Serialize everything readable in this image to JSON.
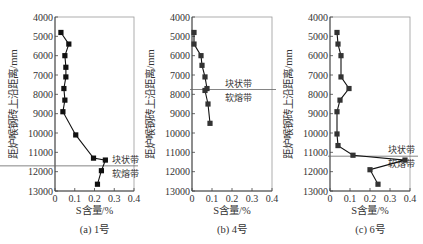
{
  "chart_data": [
    {
      "type": "line",
      "caption": "(a) 1号",
      "xlabel": "S含量/%",
      "ylabel": "距炉喉钢砖上沿距离/mm",
      "xlim": [
        0,
        0.4
      ],
      "ylim": [
        4000,
        13000
      ],
      "y_inverted": true,
      "x_ticks": [
        "0",
        "0.1",
        "0.2",
        "0.3",
        "0.4"
      ],
      "y_ticks": [
        "4000",
        "5000",
        "6000",
        "7000",
        "8000",
        "9000",
        "10000",
        "11000",
        "12000",
        "13000"
      ],
      "marker": "square",
      "boundary_depth": 11700,
      "band_labels": {
        "upper": "块状带",
        "lower": "软熔带"
      },
      "points": [
        {
          "x": 0.03,
          "y": 4800
        },
        {
          "x": 0.07,
          "y": 5400
        },
        {
          "x": 0.05,
          "y": 6000
        },
        {
          "x": 0.055,
          "y": 6600
        },
        {
          "x": 0.055,
          "y": 7100
        },
        {
          "x": 0.045,
          "y": 7700
        },
        {
          "x": 0.05,
          "y": 8300
        },
        {
          "x": 0.04,
          "y": 8900
        },
        {
          "x": 0.105,
          "y": 10100
        },
        {
          "x": 0.195,
          "y": 11300
        },
        {
          "x": 0.255,
          "y": 11400
        },
        {
          "x": 0.235,
          "y": 11950
        },
        {
          "x": 0.215,
          "y": 12650
        }
      ]
    },
    {
      "type": "line",
      "caption": "(b) 4号",
      "xlabel": "S含量/%",
      "ylabel": "距炉喉钢砖上沿距离/mm",
      "xlim": [
        0,
        0.4
      ],
      "ylim": [
        4000,
        13000
      ],
      "y_inverted": true,
      "x_ticks": [
        "0",
        "0.1",
        "0.2",
        "0.3",
        "0.4"
      ],
      "y_ticks": [
        "4000",
        "5000",
        "6000",
        "7000",
        "8000",
        "9000",
        "10000",
        "11000",
        "12000",
        "13000"
      ],
      "marker": "square",
      "boundary_depth": 7750,
      "band_labels": {
        "upper": "块状带",
        "lower": "软熔带"
      },
      "points": [
        {
          "x": 0.01,
          "y": 4800
        },
        {
          "x": 0.01,
          "y": 5400
        },
        {
          "x": 0.045,
          "y": 6000
        },
        {
          "x": 0.05,
          "y": 6500
        },
        {
          "x": 0.065,
          "y": 7100
        },
        {
          "x": 0.075,
          "y": 7700
        },
        {
          "x": 0.065,
          "y": 7800
        },
        {
          "x": 0.08,
          "y": 8500
        },
        {
          "x": 0.09,
          "y": 9500
        }
      ]
    },
    {
      "type": "line",
      "caption": "(c) 6号",
      "xlabel": "S含量/%",
      "ylabel": "距炉喉钢砖上沿距离/mm",
      "xlim": [
        0,
        0.4
      ],
      "ylim": [
        4000,
        13000
      ],
      "y_inverted": true,
      "x_ticks": [
        "0",
        "0.1",
        "0.2",
        "0.3",
        "0.4"
      ],
      "y_ticks": [
        "4000",
        "5000",
        "6000",
        "7000",
        "8000",
        "9000",
        "10000",
        "11000",
        "12000",
        "13000"
      ],
      "marker": "square",
      "boundary_depth": 11200,
      "band_labels": {
        "upper": "块状带",
        "lower": "软熔带"
      },
      "points": [
        {
          "x": 0.035,
          "y": 4800
        },
        {
          "x": 0.04,
          "y": 5400
        },
        {
          "x": 0.055,
          "y": 6000
        },
        {
          "x": 0.055,
          "y": 7100
        },
        {
          "x": 0.095,
          "y": 7700
        },
        {
          "x": 0.05,
          "y": 8300
        },
        {
          "x": 0.035,
          "y": 8900
        },
        {
          "x": 0.035,
          "y": 10050
        },
        {
          "x": 0.04,
          "y": 10650
        },
        {
          "x": 0.115,
          "y": 11150
        },
        {
          "x": 0.375,
          "y": 11400
        },
        {
          "x": 0.2,
          "y": 11900
        },
        {
          "x": 0.24,
          "y": 12650
        }
      ]
    }
  ]
}
